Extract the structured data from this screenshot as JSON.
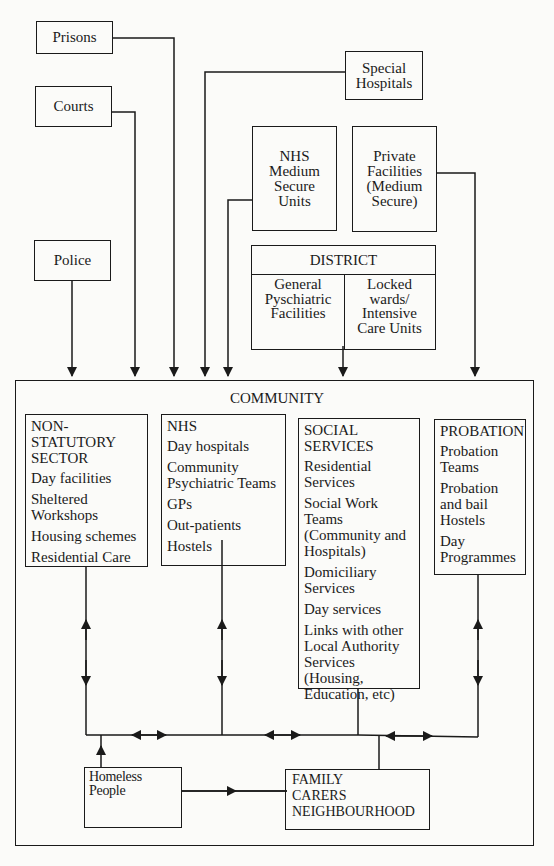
{
  "diagram": {
    "sources": {
      "prisons": "Prisons",
      "courts": "Courts",
      "police": "Police",
      "special_hospitals": [
        "Special",
        "Hospitals"
      ],
      "nhs_medium_secure": [
        "NHS",
        "Medium",
        "Secure",
        "Units"
      ],
      "private_facilities": [
        "Private",
        "Facilities",
        "(Medium",
        "Secure)"
      ],
      "district": {
        "title": "DISTRICT",
        "left": [
          "General",
          "Pyschiatric",
          "Facilities"
        ],
        "right": [
          "Locked",
          "wards/",
          "Intensive",
          "Care Units"
        ]
      }
    },
    "community": {
      "title": "COMMUNITY",
      "non_statutory": {
        "heading": [
          "NON-STATUTORY",
          "SECTOR"
        ],
        "items": [
          "Day facilities",
          "Sheltered Workshops",
          "Housing schemes",
          "Residential Care"
        ]
      },
      "nhs": {
        "heading": "NHS",
        "items": [
          "Day hospitals",
          "Community Psychiatric Teams",
          "GPs",
          "Out-patients",
          "Hostels"
        ]
      },
      "social_services": {
        "heading": [
          "SOCIAL",
          "SERVICES"
        ],
        "items": [
          "Residential Services",
          "Social Work Teams (Community and Hospitals)",
          "Domiciliary Services",
          "Day services",
          "Links with other Local Authority Services (Housing, Education, etc)"
        ]
      },
      "probation": {
        "heading": "PROBATION",
        "items": [
          "Probation Teams",
          "Probation and bail Hostels",
          "Day Programmes"
        ]
      },
      "homeless": "Homeless People",
      "family": [
        "FAMILY",
        "CARERS",
        "NEIGHBOURHOOD"
      ]
    },
    "colors": {
      "line": "#1a1a1a",
      "background": "#fbfbf9"
    }
  }
}
